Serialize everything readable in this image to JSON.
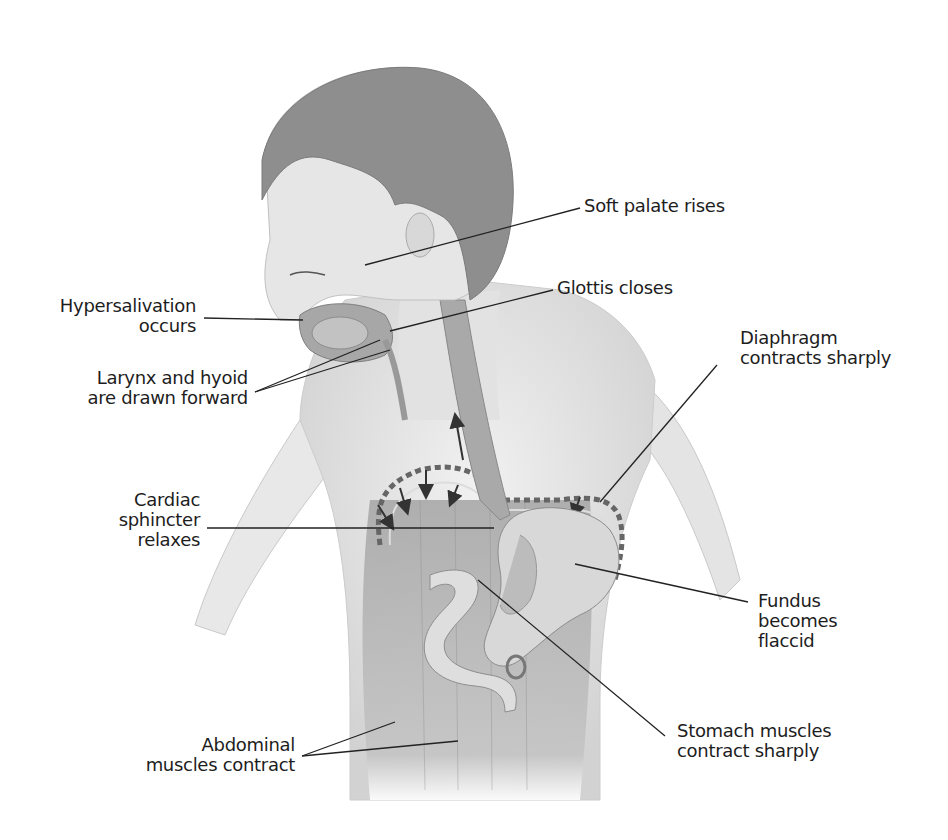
{
  "figure": {
    "colors": {
      "background": "#ffffff",
      "text": "#1d1d1d",
      "leader_lines": "#222222",
      "hair": "#8c8c8c",
      "skin": "#e6e6e6",
      "tissue": "#b5b5b5",
      "organ": "#d4d4d4"
    }
  },
  "labels": {
    "soft_palate": "Soft palate rises",
    "glottis": "Glottis closes",
    "hypersalivation": "Hypersalivation\noccurs",
    "larynx": "Larynx and hyoid\nare drawn forward",
    "diaphragm": "Diaphragm\ncontracts sharply",
    "cardiac": "Cardiac\nsphincter\nrelaxes",
    "fundus": "Fundus\nbecomes\nflaccid",
    "stomach": "Stomach muscles\ncontract sharply",
    "abdominal": "Abdominal\nmuscles contract"
  }
}
